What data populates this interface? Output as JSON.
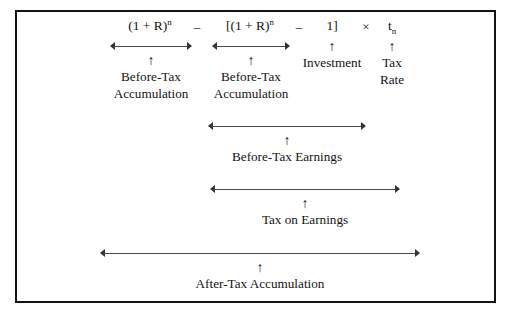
{
  "figure": {
    "border_color": "#131313",
    "background_color": "#ffffff",
    "arrow_color": "#4a4a4a"
  },
  "formula": {
    "term1_base": "(1 + R)",
    "term1_exp": "n",
    "operator1": "–",
    "term2_base": "[(1 + R)",
    "term2_exp": "n",
    "operator2": "–",
    "term3": "1]",
    "operator3": "×",
    "term4_base": "t",
    "term4_sub": "n"
  },
  "annotations": {
    "arrow_glyph": "↑",
    "term1_label_line1": "Before-Tax",
    "term1_label_line2": "Accumulation",
    "term2_label_line1": "Before-Tax",
    "term2_label_line2": "Accumulation",
    "term3_label": "Investment",
    "term4_label_line1": "Tax",
    "term4_label_line2": "Rate",
    "span_before_tax_earnings": "Before-Tax Earnings",
    "span_tax_on_earnings": "Tax on Earnings",
    "span_after_tax_accumulation": "After-Tax Accumulation"
  }
}
